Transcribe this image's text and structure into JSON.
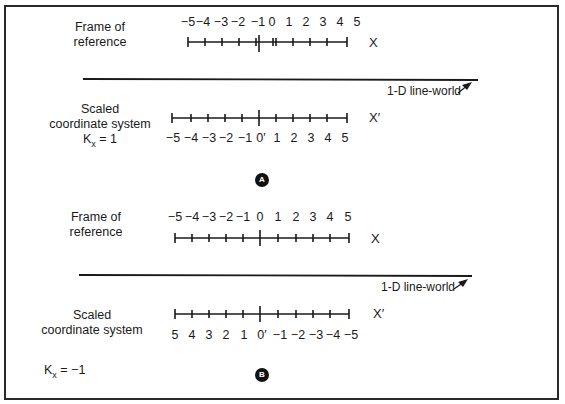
{
  "panels": [
    {
      "id": "A",
      "badge": "A",
      "frame_label": [
        "Frame of",
        "reference"
      ],
      "frame_axis_name": "X",
      "frame_ticks": [
        "−5",
        "−4",
        "−3",
        "−2",
        "−1",
        "0",
        "1",
        "2",
        "3",
        "4",
        "5"
      ],
      "world_label": "1-D line-world",
      "scaled_label": [
        "Scaled",
        "coordinate system"
      ],
      "k_label": "Kx = 1",
      "k_sym": "K",
      "k_sub": "x",
      "k_val": " = 1",
      "scaled_axis_name": "X′",
      "scaled_ticks": [
        "−5",
        "−4",
        "−3",
        "−2",
        "−1",
        "0′",
        "1",
        "2",
        "3",
        "4",
        "5"
      ]
    },
    {
      "id": "B",
      "badge": "B",
      "frame_label": [
        "Frame of",
        "reference"
      ],
      "frame_axis_name": "X",
      "frame_ticks": [
        "−5",
        "−4",
        "−3",
        "−2",
        "−1",
        "0",
        "1",
        "2",
        "3",
        "4",
        "5"
      ],
      "world_label": "1-D line-world",
      "scaled_label": [
        "Scaled",
        "coordinate system"
      ],
      "k_label": "Kx = −1",
      "k_sym": "K",
      "k_sub": "x",
      "k_val": " = −1",
      "scaled_axis_name": "X′",
      "scaled_ticks": [
        "5",
        "4",
        "3",
        "2",
        "1",
        "0′",
        "−1",
        "−2",
        "−3",
        "−4",
        "−5"
      ]
    }
  ]
}
